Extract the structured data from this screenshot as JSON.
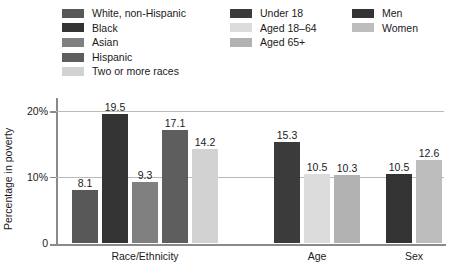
{
  "chart_data": {
    "type": "bar",
    "title": "",
    "xlabel": "",
    "ylabel": "Percentage in poverty",
    "ylim": [
      0,
      22
    ],
    "yticks": [
      0,
      10,
      20
    ],
    "ytick_labels": [
      "0",
      "10%",
      "20%"
    ],
    "grid": "horizontal gridlines at 10% and 20%",
    "legend_position": "top",
    "categories": [
      "Race/Ethnicity",
      "Age",
      "Sex"
    ],
    "groups": [
      {
        "name": "Race/Ethnicity",
        "bars": [
          {
            "label": "White, non-Hispanic",
            "value": 8.1,
            "value_text": "8.1",
            "color": "#585858"
          },
          {
            "label": "Black",
            "value": 19.5,
            "value_text": "19.5",
            "color": "#333333"
          },
          {
            "label": "Asian",
            "value": 9.3,
            "value_text": "9.3",
            "color": "#808080"
          },
          {
            "label": "Hispanic",
            "value": 17.1,
            "value_text": "17.1",
            "color": "#5e5e5e"
          },
          {
            "label": "Two or more races",
            "value": 14.2,
            "value_text": "14.2",
            "color": "#d2d2d2"
          }
        ]
      },
      {
        "name": "Age",
        "bars": [
          {
            "label": "Under 18",
            "value": 15.3,
            "value_text": "15.3",
            "color": "#3b3b3b"
          },
          {
            "label": "Aged 18–64",
            "value": 10.5,
            "value_text": "10.5",
            "color": "#dcdcdc"
          },
          {
            "label": "Aged 65+",
            "value": 10.3,
            "value_text": "10.3",
            "color": "#b2b2b2"
          }
        ]
      },
      {
        "name": "Sex",
        "bars": [
          {
            "label": "Men",
            "value": 10.5,
            "value_text": "10.5",
            "color": "#333333"
          },
          {
            "label": "Women",
            "value": 12.6,
            "value_text": "12.6",
            "color": "#bdbdbd"
          }
        ]
      }
    ]
  },
  "legend": {
    "columns": [
      {
        "items": [
          {
            "label": "White, non-Hispanic",
            "color": "#585858"
          },
          {
            "label": "Black",
            "color": "#333333"
          },
          {
            "label": "Asian",
            "color": "#808080"
          },
          {
            "label": "Hispanic",
            "color": "#5e5e5e"
          },
          {
            "label": "Two or more races",
            "color": "#d2d2d2"
          }
        ]
      },
      {
        "items": [
          {
            "label": "Under 18",
            "color": "#3b3b3b"
          },
          {
            "label": "Aged 18–64",
            "color": "#dcdcdc"
          },
          {
            "label": "Aged 65+",
            "color": "#b2b2b2"
          }
        ]
      },
      {
        "items": [
          {
            "label": "Men",
            "color": "#333333"
          },
          {
            "label": "Women",
            "color": "#bdbdbd"
          }
        ]
      }
    ]
  },
  "axis": {
    "y_title": "Percentage in poverty",
    "y_labels": [
      "20%",
      "10%",
      "0"
    ],
    "x_labels": [
      "Race/Ethnicity",
      "Age",
      "Sex"
    ]
  },
  "colors": {
    "axis_line": "#8a8a8a",
    "gridline": "#b9b9b9",
    "text": "#1a1a1a",
    "background": "#ffffff"
  }
}
